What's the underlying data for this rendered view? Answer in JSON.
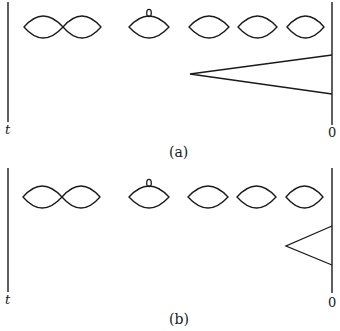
{
  "figure": {
    "panels": [
      {
        "id": "a",
        "caption": "(a)",
        "left_axis_label": "t",
        "right_axis_label": "0",
        "lens_row_center_y": 27,
        "left_line": {
          "x": 8,
          "y1": 2,
          "y2": 122
        },
        "right_line": {
          "x": 332,
          "y1": 2,
          "y2": 125
        },
        "lenses": [
          {
            "kind": "joined-pair",
            "x1": 24,
            "x2": 101
          },
          {
            "kind": "with-loop",
            "x1": 129,
            "x2": 169
          },
          {
            "kind": "single",
            "x1": 189,
            "x2": 229
          },
          {
            "kind": "single",
            "x1": 238,
            "x2": 277
          },
          {
            "kind": "single",
            "x1": 287,
            "x2": 324
          }
        ],
        "wedge": {
          "apex_x": 190,
          "apex_y": 74,
          "top_y": 55,
          "bottom_y": 94
        }
      },
      {
        "id": "b",
        "caption": "(b)",
        "left_axis_label": "t",
        "right_axis_label": "0",
        "lens_row_center_y": 194,
        "left_line": {
          "x": 8,
          "y1": 168,
          "y2": 292
        },
        "right_line": {
          "x": 332,
          "y1": 168,
          "y2": 293
        },
        "lenses": [
          {
            "kind": "joined-pair",
            "x1": 24,
            "x2": 101
          },
          {
            "kind": "with-loop",
            "x1": 129,
            "x2": 169
          },
          {
            "kind": "single",
            "x1": 189,
            "x2": 229
          },
          {
            "kind": "single",
            "x1": 238,
            "x2": 277
          },
          {
            "kind": "single",
            "x1": 287,
            "x2": 324
          }
        ],
        "wedge": {
          "apex_x": 286,
          "apex_y": 246,
          "top_y": 226,
          "bottom_y": 265
        }
      }
    ]
  }
}
